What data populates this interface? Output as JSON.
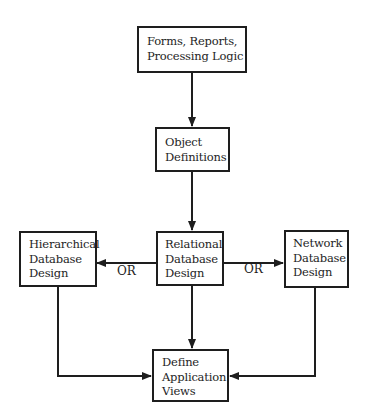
{
  "diagram": {
    "type": "flowchart",
    "nodes": {
      "forms": {
        "lines": [
          "Forms, Reports,",
          "Processing Logic"
        ]
      },
      "objects": {
        "lines": [
          "Object",
          "Definitions"
        ]
      },
      "relational": {
        "lines": [
          "Relational",
          "Database",
          "Design"
        ]
      },
      "hierarchical": {
        "lines": [
          "Hierarchical",
          "Database",
          "Design"
        ]
      },
      "network": {
        "lines": [
          "Network",
          "Database",
          "Design"
        ]
      },
      "views": {
        "lines": [
          "Define",
          "Application",
          "Views"
        ]
      }
    },
    "edge_labels": {
      "or_left": "OR",
      "or_right": "OR"
    },
    "edges": [
      {
        "from": "forms",
        "to": "objects"
      },
      {
        "from": "objects",
        "to": "relational"
      },
      {
        "from": "relational",
        "to": "hierarchical",
        "label": "OR"
      },
      {
        "from": "relational",
        "to": "network",
        "label": "OR"
      },
      {
        "from": "relational",
        "to": "views"
      },
      {
        "from": "hierarchical",
        "to": "views"
      },
      {
        "from": "network",
        "to": "views"
      }
    ],
    "colors": {
      "stroke": "#1e1e1e",
      "background": "#ffffff"
    }
  }
}
